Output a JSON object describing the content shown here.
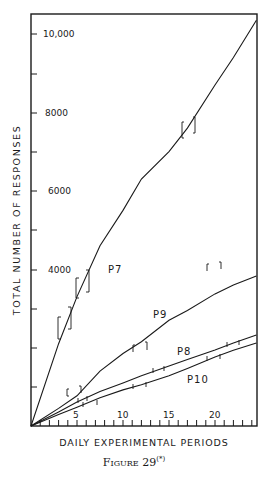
{
  "chart_data": {
    "type": "line",
    "title": "",
    "caption": "Figure 29",
    "caption_superscript": "(*)",
    "xlabel": "DAILY EXPERIMENTAL PERIODS",
    "ylabel": "TOTAL NUMBER OF RESPONSES",
    "xlim": [
      0,
      24.5
    ],
    "ylim": [
      0,
      10500
    ],
    "x_ticks": [
      5,
      10,
      15,
      20
    ],
    "x_minor_tick_step": 1,
    "y_ticks": [
      4000,
      6000,
      8000,
      10000
    ],
    "y_tick_labels": [
      "4000",
      "6000",
      "8000",
      "10,000"
    ],
    "y_minor_tick_step": 1000,
    "grid": false,
    "legend": "inline labels",
    "x": [
      0,
      3,
      5,
      7.5,
      10,
      12,
      15,
      17,
      20,
      22,
      24.5
    ],
    "series": [
      {
        "name": "P7",
        "values": [
          0,
          2100,
          3300,
          4600,
          5500,
          6300,
          7000,
          7600,
          8700,
          9400,
          10350
        ]
      },
      {
        "name": "P9",
        "values": [
          0,
          450,
          770,
          1400,
          1850,
          2150,
          2700,
          2950,
          3370,
          3600,
          3830
        ]
      },
      {
        "name": "P8",
        "values": [
          0,
          360,
          610,
          880,
          1100,
          1280,
          1530,
          1700,
          1940,
          2120,
          2320
        ]
      },
      {
        "name": "P10",
        "values": [
          0,
          290,
          480,
          720,
          920,
          1050,
          1280,
          1470,
          1760,
          1930,
          2120
        ]
      }
    ],
    "series_label_positions": {
      "P7": [
        9,
        4000
      ],
      "P9": [
        13,
        2600
      ],
      "P8": [
        14.5,
        1700
      ],
      "P10": [
        15,
        1000
      ]
    },
    "annotations": "Bracket marks on each curve indicate session boundaries / points of change"
  }
}
